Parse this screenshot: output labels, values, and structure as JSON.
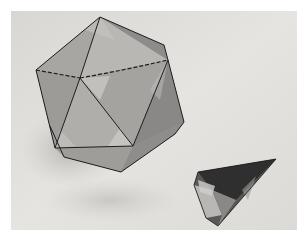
{
  "image": {
    "description": "Black-and-white photograph of a paper icosahedron model with dashed/solid edge lines and a small transparent glass pyramid-shaped crystal on a light surface",
    "colors": {
      "border": "#ffffff",
      "background_light": "#e4e2df",
      "background_shadow": "#c8c6c3",
      "face_dark": "#8c8a88",
      "face_mid": "#a3a19f",
      "face_light": "#c6c4c1",
      "edge": "#1e1e1e",
      "crystal_dark": "#2e2e2e",
      "crystal_light": "#b8b6b4"
    },
    "objects": [
      {
        "name": "icosahedron",
        "material": "paper"
      },
      {
        "name": "crystal-pyramid",
        "material": "glass"
      }
    ]
  }
}
